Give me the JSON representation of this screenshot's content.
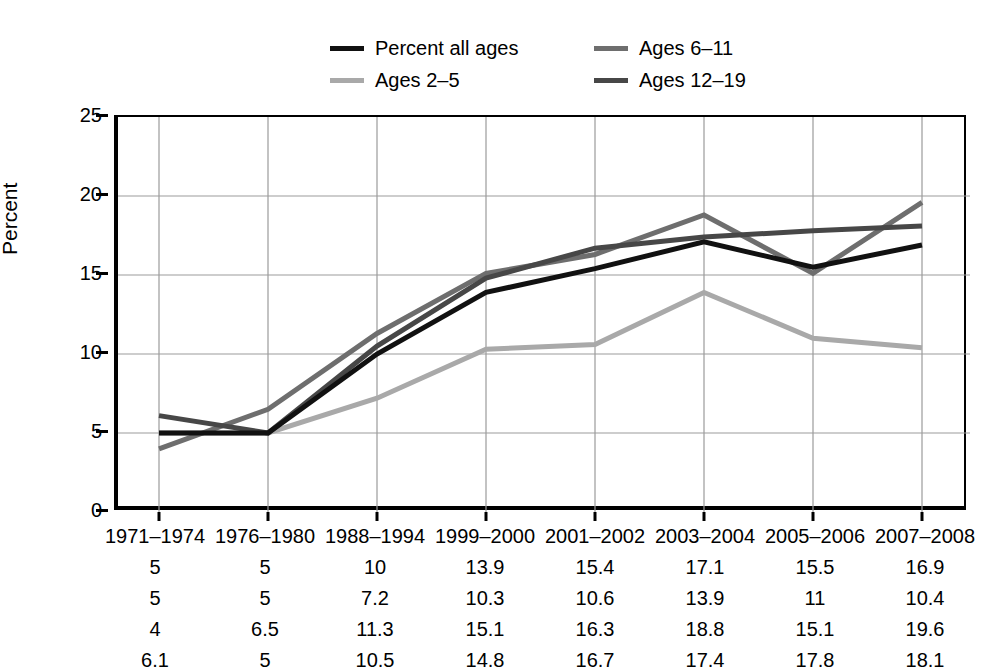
{
  "chart_data": {
    "type": "line",
    "title": "",
    "subtitle": "",
    "xlabel": "",
    "ylabel": "Percent",
    "ylim": [
      0,
      25
    ],
    "yticks": [
      0,
      5,
      10,
      15,
      20,
      25
    ],
    "ytick_labels": [
      "0",
      "5",
      "10",
      "15",
      "20",
      "25"
    ],
    "grid": true,
    "legend_position": "top-center",
    "categories": [
      "1971–1974",
      "1976–1980",
      "1988–1994",
      "1999–2000",
      "2001–2002",
      "2003–2004",
      "2005–2006",
      "2007–2008"
    ],
    "series": [
      {
        "name": "Percent all ages",
        "color": "#111111",
        "values": [
          5,
          5,
          10,
          13.9,
          15.4,
          17.1,
          15.5,
          16.9
        ],
        "value_labels": [
          "5",
          "5",
          "10",
          "13.9",
          "15.4",
          "17.1",
          "15.5",
          "16.9"
        ]
      },
      {
        "name": "Ages 2–5",
        "color": "#a9a9a9",
        "values": [
          5,
          5,
          7.2,
          10.3,
          10.6,
          13.9,
          11,
          10.4
        ],
        "value_labels": [
          "5",
          "5",
          "7.2",
          "10.3",
          "10.6",
          "13.9",
          "11",
          "10.4"
        ]
      },
      {
        "name": "Ages 6–11",
        "color": "#6e6e6e",
        "values": [
          4,
          6.5,
          11.3,
          15.1,
          16.3,
          18.8,
          15.1,
          19.6
        ],
        "value_labels": [
          "4",
          "6.5",
          "11.3",
          "15.1",
          "16.3",
          "18.8",
          "15.1",
          "19.6"
        ]
      },
      {
        "name": "Ages 12–19",
        "color": "#474747",
        "values": [
          6.1,
          5,
          10.5,
          14.8,
          16.7,
          17.4,
          17.8,
          18.1
        ],
        "value_labels": [
          "6.1",
          "5",
          "10.5",
          "14.8",
          "16.7",
          "17.4",
          "17.8",
          "18.1"
        ]
      }
    ]
  },
  "legend": {
    "items": [
      {
        "label": "Percent all ages",
        "color": "#111111"
      },
      {
        "label": "Ages 2–5",
        "color": "#a9a9a9"
      },
      {
        "label": "Ages 6–11",
        "color": "#6e6e6e"
      },
      {
        "label": "Ages 12–19",
        "color": "#474747"
      }
    ]
  },
  "axes": {
    "y_title": "Percent"
  }
}
